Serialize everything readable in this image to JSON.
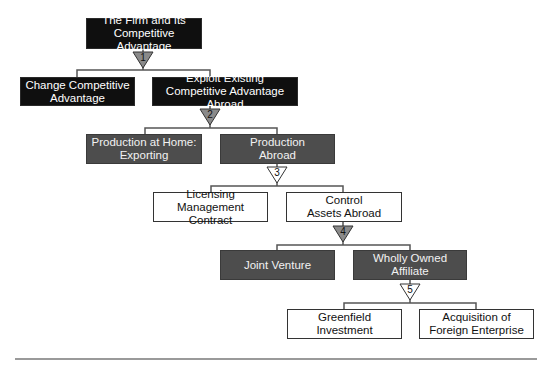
{
  "diagram": {
    "type": "decision-tree",
    "colors": {
      "black_box": "#0f0f0f",
      "gray_box": "#4d4d4d",
      "white_box": "#ffffff",
      "connector": "#555555",
      "gray_triangle": "#8a8a8a",
      "rule": "#9a9a9a"
    },
    "nodes": {
      "root": {
        "label": "The Firm and Its\nCompetitive Advantage",
        "style": "black"
      },
      "change": {
        "label": "Change Competitive\nAdvantage",
        "style": "black"
      },
      "exploit": {
        "label": "Exploit Existing\nCompetitive Advantage Abroad",
        "style": "black"
      },
      "home": {
        "label": "Production at Home:\nExporting",
        "style": "gray"
      },
      "abroad": {
        "label": "Production\nAbroad",
        "style": "gray"
      },
      "licensing": {
        "label": "Licensing\nManagement Contract",
        "style": "white"
      },
      "control": {
        "label": "Control\nAssets Abroad",
        "style": "white"
      },
      "joint": {
        "label": "Joint Venture",
        "style": "gray"
      },
      "wholly": {
        "label": "Wholly Owned\nAffiliate",
        "style": "gray"
      },
      "greenfield": {
        "label": "Greenfield Investment",
        "style": "white"
      },
      "acquisition": {
        "label": "Acquisition of\nForeign Enterprise",
        "style": "white"
      }
    },
    "steps": [
      {
        "number": "1",
        "fill": "gray"
      },
      {
        "number": "2",
        "fill": "gray"
      },
      {
        "number": "3",
        "fill": "white"
      },
      {
        "number": "4",
        "fill": "gray"
      },
      {
        "number": "5",
        "fill": "white"
      }
    ]
  }
}
